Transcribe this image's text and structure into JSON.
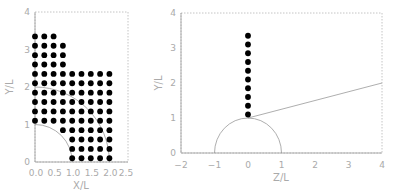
{
  "chart_data": [
    {
      "type": "scatter",
      "title": "",
      "xlabel": "X/L",
      "ylabel": "Y/L",
      "xlim": [
        0,
        2.5
      ],
      "ylim": [
        0,
        4
      ],
      "xticks": [
        "0.0",
        "0.5",
        "1.0",
        "1.5",
        "2.0",
        "2.5"
      ],
      "yticks": [
        "0",
        "1",
        "2",
        "3",
        "4"
      ],
      "grid": false,
      "legend": null,
      "dot_spacing": 0.25,
      "points_description": "Square lattice of points (spacing 0.25) in region above unit quarter circle: columns x=0..0.75 for y=1.1..3.35 (top rows shorter), columns x=1.0..2.0 for y=0.1..2.35",
      "curves": [
        {
          "name": "unit quarter circle",
          "radius": 1.0
        },
        {
          "name": "quarter circle r=2",
          "radius": 2.0
        }
      ],
      "series": [
        {
          "name": "points",
          "x": [
            0,
            0.25,
            0.5,
            0,
            0.25,
            0.5,
            0.75,
            0,
            0.25,
            0.5,
            0.75,
            0,
            0.25,
            0.5,
            0.75,
            0,
            0.25,
            0.5,
            0.75,
            1.0,
            1.25,
            1.5,
            1.75,
            2.0,
            0,
            0.25,
            0.5,
            0.75,
            1.0,
            1.25,
            1.5,
            1.75,
            2.0,
            0,
            0.25,
            0.5,
            0.75,
            1.0,
            1.25,
            1.5,
            1.75,
            2.0,
            0,
            0.25,
            0.5,
            0.75,
            1.0,
            1.25,
            1.5,
            1.75,
            2.0,
            0,
            0.25,
            0.5,
            0.75,
            1.0,
            1.25,
            1.5,
            1.75,
            2.0,
            0,
            0.25,
            0.5,
            0.75,
            1.0,
            1.25,
            1.5,
            1.75,
            2.0,
            0.75,
            1.0,
            1.25,
            1.5,
            1.75,
            2.0,
            1.0,
            1.25,
            1.5,
            1.75,
            2.0,
            1.0,
            1.25,
            1.5,
            1.75,
            2.0,
            1.0,
            1.25,
            1.5,
            1.75,
            2.0
          ],
          "y": [
            3.35,
            3.35,
            3.35,
            3.1,
            3.1,
            3.1,
            3.1,
            2.85,
            2.85,
            2.85,
            2.85,
            2.6,
            2.6,
            2.6,
            2.6,
            2.35,
            2.35,
            2.35,
            2.35,
            2.35,
            2.35,
            2.35,
            2.35,
            2.35,
            2.1,
            2.1,
            2.1,
            2.1,
            2.1,
            2.1,
            2.1,
            2.1,
            2.1,
            1.85,
            1.85,
            1.85,
            1.85,
            1.85,
            1.85,
            1.85,
            1.85,
            1.85,
            1.6,
            1.6,
            1.6,
            1.6,
            1.6,
            1.6,
            1.6,
            1.6,
            1.6,
            1.35,
            1.35,
            1.35,
            1.35,
            1.35,
            1.35,
            1.35,
            1.35,
            1.35,
            1.1,
            1.1,
            1.1,
            1.1,
            1.1,
            1.1,
            1.1,
            1.1,
            1.1,
            0.85,
            0.85,
            0.85,
            0.85,
            0.85,
            0.85,
            0.6,
            0.6,
            0.6,
            0.6,
            0.6,
            0.35,
            0.35,
            0.35,
            0.35,
            0.35,
            0.1,
            0.1,
            0.1,
            0.1,
            0.1
          ]
        }
      ]
    },
    {
      "type": "scatter",
      "title": "",
      "xlabel": "Z/L",
      "ylabel": "Y/L",
      "xlim": [
        -2,
        4
      ],
      "ylim": [
        0,
        4
      ],
      "xticks": [
        "-2",
        "-1",
        "0",
        "1",
        "2",
        "3",
        "4"
      ],
      "yticks": [
        "0",
        "1",
        "2",
        "3",
        "4"
      ],
      "grid": false,
      "legend": null,
      "curves": [
        {
          "name": "unit semicircle",
          "center": [
            0,
            0
          ],
          "radius": 1.0
        },
        {
          "name": "line",
          "from": [
            0,
            1.0
          ],
          "to": [
            4,
            2.0
          ]
        }
      ],
      "series": [
        {
          "name": "points",
          "x": [
            0,
            0,
            0,
            0,
            0,
            0,
            0,
            0,
            0,
            0
          ],
          "y": [
            1.1,
            1.35,
            1.6,
            1.85,
            2.1,
            2.35,
            2.6,
            2.85,
            3.1,
            3.35
          ]
        }
      ]
    }
  ],
  "left_plot": {
    "xlabel": "X/L",
    "ylabel": "Y/L",
    "xticks": [
      "0.0",
      "0.5",
      "1.0",
      "1.5",
      "2.0",
      "2.5"
    ],
    "yticks": [
      "0",
      "1",
      "2",
      "3",
      "4"
    ]
  },
  "right_plot": {
    "xlabel": "Z/L",
    "ylabel": "Y/L",
    "xticks": [
      "−2",
      "−1",
      "0",
      "1",
      "2",
      "3",
      "4"
    ],
    "yticks": [
      "0",
      "1",
      "2",
      "3",
      "4"
    ]
  }
}
